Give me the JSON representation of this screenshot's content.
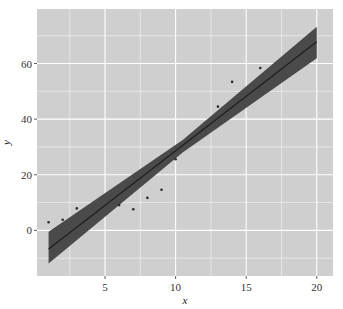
{
  "chart_data": {
    "type": "scatter",
    "title": "",
    "xlabel": "x",
    "ylabel": "y",
    "xlim": [
      0.18,
      21.15
    ],
    "ylim": [
      -16.4,
      79.6
    ],
    "x_ticks": [
      5,
      10,
      15,
      20
    ],
    "y_ticks": [
      0,
      20,
      40,
      60
    ],
    "x_minor_gridlines": [
      2.5,
      7.5,
      12.5,
      17.5
    ],
    "y_minor_gridlines": [
      -10,
      10,
      30,
      50,
      70
    ],
    "grid": true,
    "legend": "none",
    "points": [
      {
        "x": 1,
        "y": 2.9
      },
      {
        "x": 2,
        "y": 3.8
      },
      {
        "x": 3,
        "y": 7.9
      },
      {
        "x": 6,
        "y": 9.1
      },
      {
        "x": 7,
        "y": 7.6
      },
      {
        "x": 8,
        "y": 11.7
      },
      {
        "x": 9,
        "y": 14.6
      },
      {
        "x": 10,
        "y": 25.6
      },
      {
        "x": 13,
        "y": 44.5
      },
      {
        "x": 14,
        "y": 53.4
      },
      {
        "x": 16,
        "y": 58.4
      }
    ],
    "fit_line": {
      "x": [
        1,
        20
      ],
      "y": [
        -6.7,
        67.8
      ]
    },
    "confidence_band": {
      "x": [
        1,
        10.5,
        20
      ],
      "lower": [
        -11.9,
        28.0,
        61.9
      ],
      "upper": [
        -0.5,
        32.5,
        73.2
      ]
    },
    "colors": {
      "panel_background": "#cfcfcf",
      "gridline": "#ffffff",
      "band": "#4a4a4a",
      "line": "#1e1e1e",
      "point": "#2a2a2a"
    }
  }
}
